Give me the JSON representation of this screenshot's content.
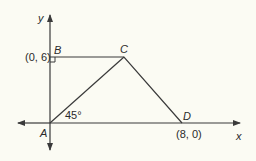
{
  "diagram": {
    "axes": {
      "x_label": "x",
      "y_label": "y"
    },
    "points": {
      "A": {
        "label": "A"
      },
      "B": {
        "label": "B",
        "coord": "(0, 6)"
      },
      "C": {
        "label": "C"
      },
      "D": {
        "label": "D",
        "coord": "(8, 0)"
      }
    },
    "angle": {
      "vertex": "A",
      "value": "45°"
    },
    "colors": {
      "line": "#3a3a3a",
      "background": "#fbfbf3"
    }
  }
}
